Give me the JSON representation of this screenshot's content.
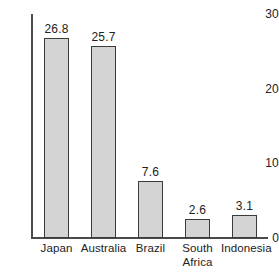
{
  "chart_data": {
    "type": "bar",
    "title": "",
    "subtitle": "",
    "xlabel": "",
    "ylabel": "",
    "categories": [
      "Japan",
      "Australia",
      "Brazil",
      "South Africa",
      "Indonesia"
    ],
    "values": [
      26.8,
      25.7,
      7.6,
      2.6,
      3.1
    ],
    "value_labels": [
      "26.8",
      "25.7",
      "7.6",
      "2.6",
      "3.1"
    ],
    "ylim": [
      0,
      30
    ],
    "yticks": [
      0,
      10,
      20,
      30
    ],
    "ytick_labels": [
      "0",
      "10",
      "20",
      "30"
    ],
    "grid": false,
    "legend": false,
    "legend_position": "none",
    "annotations": [],
    "bar_fill_color": "#d4d4d4",
    "bar_edge_color": "#3b3b3b",
    "axis_color": "#4a4a4a",
    "text_color": "#222222",
    "background_color": "#ffffff"
  },
  "x_label_lines": [
    [
      "Japan"
    ],
    [
      "Australia"
    ],
    [
      "Brazil"
    ],
    [
      "South",
      "Africa"
    ],
    [
      "Indonesia"
    ]
  ]
}
